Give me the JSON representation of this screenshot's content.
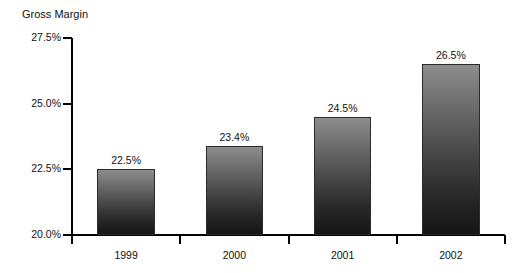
{
  "chart_data": {
    "type": "bar",
    "title": "Gross Margin",
    "xlabel": "",
    "ylabel": "Gross Margin",
    "categories": [
      "1999",
      "2000",
      "2001",
      "2002"
    ],
    "values": [
      22.5,
      23.4,
      24.5,
      26.5
    ],
    "value_labels": [
      "22.5%",
      "23.4%",
      "24.5%",
      "26.5%"
    ],
    "series": [
      {
        "name": "Gross Margin",
        "values": [
          22.5,
          23.4,
          24.5,
          26.5
        ]
      }
    ],
    "ylim": [
      20.0,
      27.5
    ],
    "yticks": [
      20.0,
      22.5,
      25.0,
      27.5
    ],
    "ytick_labels": [
      "20.0%",
      "22.5%",
      "25.0%",
      "27.5%"
    ],
    "grid": false,
    "legend": "none",
    "units": "percent",
    "colors": {
      "bar_gradient_top": "#8d8d8d",
      "bar_gradient_bottom": "#141414",
      "bar_border": "#2b2b2b",
      "axis": "#000000",
      "text": "#111111",
      "background": "#ffffff"
    }
  }
}
